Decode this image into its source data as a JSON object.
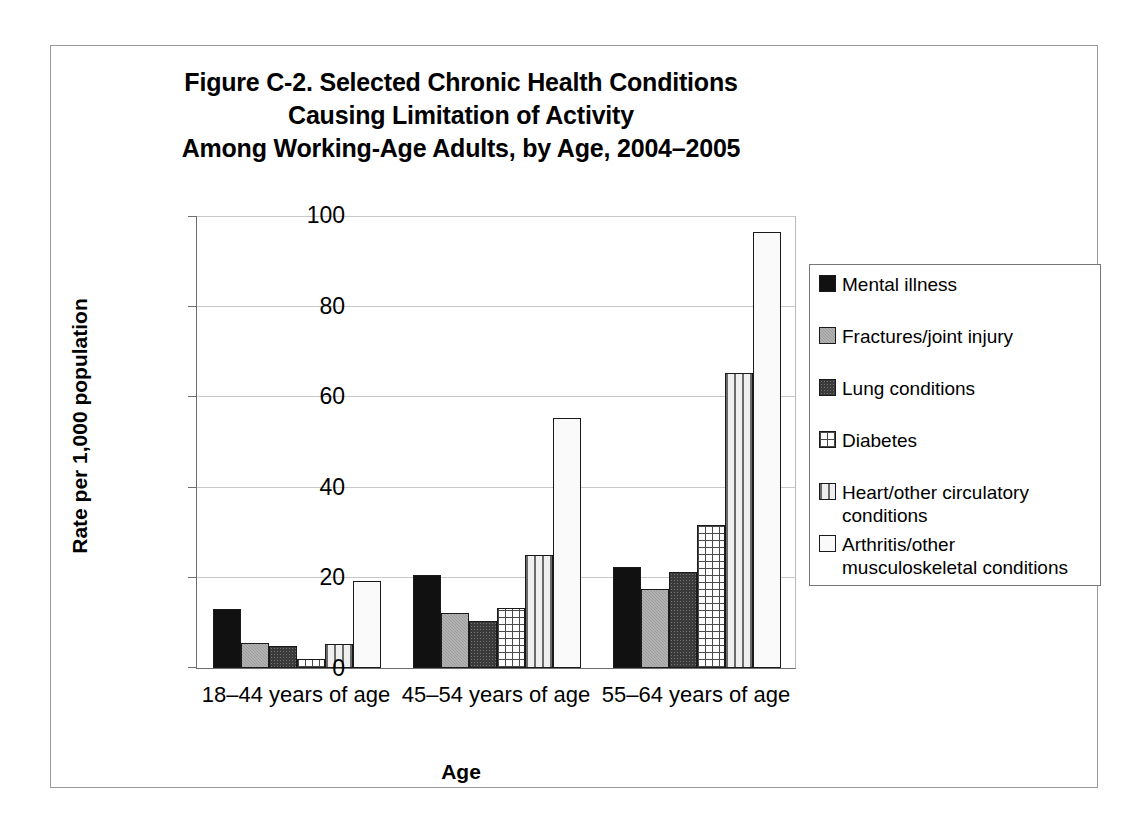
{
  "figure": {
    "title_lines": [
      "Figure C-2. Selected Chronic Health Conditions",
      "Causing Limitation of Activity",
      "Among Working-Age Adults, by Age, 2004–2005"
    ]
  },
  "chart_data": {
    "type": "bar",
    "title": "Figure C-2. Selected Chronic Health Conditions Causing Limitation of Activity Among Working-Age Adults, by Age, 2004–2005",
    "xlabel": "Age",
    "ylabel": "Rate per 1,000 population",
    "categories": [
      "18–44 years of age",
      "45–54 years of age",
      "55–64 years of age"
    ],
    "ylim": [
      0,
      100
    ],
    "yticks": [
      0,
      20,
      40,
      60,
      80,
      100
    ],
    "ytick_labels": [
      "0",
      "20",
      "40",
      "60",
      "80",
      "100"
    ],
    "grid": true,
    "legend_position": "right",
    "series": [
      {
        "name": "Mental illness",
        "values": [
          13.0,
          20.6,
          22.3
        ],
        "pattern": "solid-black",
        "color": "#111111"
      },
      {
        "name": "Fractures/joint injury",
        "values": [
          5.6,
          12.3,
          17.5
        ],
        "pattern": "medium-gray",
        "color": "#9c9c9c"
      },
      {
        "name": "Lung conditions",
        "values": [
          4.9,
          10.4,
          21.4
        ],
        "pattern": "dark-gray-dotted",
        "color": "#3a3a3a"
      },
      {
        "name": "Diabetes",
        "values": [
          2.1,
          13.2,
          31.6
        ],
        "pattern": "fine-grid",
        "color": "#fdfdfd"
      },
      {
        "name": "Heart/other circulatory conditions",
        "values": [
          5.4,
          25.1,
          65.4
        ],
        "pattern": "vertical-stripes",
        "color": "#efefef"
      },
      {
        "name": "Arthritis/other musculoskeletal conditions",
        "values": [
          19.4,
          55.4,
          96.6
        ],
        "pattern": "light-dots",
        "color": "#fafafa"
      }
    ]
  }
}
